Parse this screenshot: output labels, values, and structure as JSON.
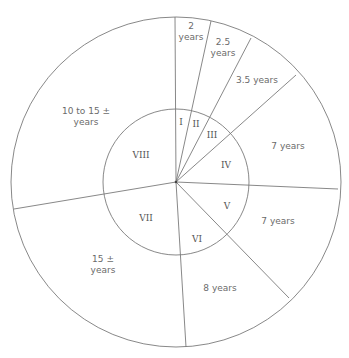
{
  "diagram": {
    "center": [
      176,
      182
    ],
    "outer_radius": 165,
    "inner_radius": 73,
    "colors": {
      "line": "#7a7a7a",
      "text": "#6b6b6b",
      "roman": "#555555"
    },
    "spokes": [
      {
        "id": "I-VIII",
        "end": [
          175,
          17
        ]
      },
      {
        "id": "I-II",
        "end": [
          211,
          21
        ]
      },
      {
        "id": "II-III",
        "end": [
          251,
          38
        ]
      },
      {
        "id": "III-IV",
        "end": [
          296,
          75
        ]
      },
      {
        "id": "IV-V",
        "end": [
          338,
          189
        ]
      },
      {
        "id": "V-VI",
        "end": [
          289,
          298
        ]
      },
      {
        "id": "VI-VII",
        "end": [
          186,
          347
        ]
      },
      {
        "id": "VII-VIII",
        "end": [
          14,
          209
        ]
      }
    ],
    "sectors": [
      {
        "roman": "I",
        "roman_pos": [
          181,
          125
        ],
        "age_lines": [
          "2",
          "years"
        ],
        "age_pos": [
          191,
          29
        ]
      },
      {
        "roman": "II",
        "roman_pos": [
          196,
          127
        ],
        "age_lines": [
          "2.5",
          "years"
        ],
        "age_pos": [
          223,
          45
        ]
      },
      {
        "roman": "III",
        "roman_pos": [
          212,
          138
        ],
        "age_lines": [
          "3.5 years"
        ],
        "age_pos": [
          257,
          83
        ]
      },
      {
        "roman": "IV",
        "roman_pos": [
          226,
          168
        ],
        "age_lines": [
          "7 years"
        ],
        "age_pos": [
          288,
          149
        ]
      },
      {
        "roman": "V",
        "roman_pos": [
          227,
          209
        ],
        "age_lines": [
          "7 years"
        ],
        "age_pos": [
          278,
          224
        ]
      },
      {
        "roman": "VI",
        "roman_pos": [
          197,
          242
        ],
        "age_lines": [
          "8 years"
        ],
        "age_pos": [
          220,
          291
        ]
      },
      {
        "roman": "VII",
        "roman_pos": [
          146,
          221
        ],
        "age_lines": [
          "15 ±",
          "years"
        ],
        "age_pos": [
          103,
          262
        ]
      },
      {
        "roman": "VIII",
        "roman_pos": [
          141,
          158
        ],
        "age_lines": [
          "10 to 15 ±",
          "years"
        ],
        "age_pos": [
          86,
          114
        ]
      }
    ]
  }
}
